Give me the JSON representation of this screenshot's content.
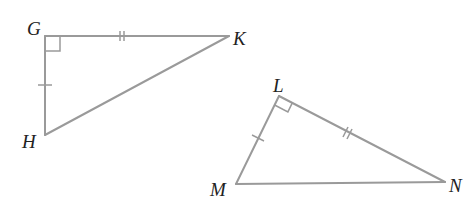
{
  "diagram": {
    "type": "geometry",
    "colors": {
      "line": "#9a9a9a",
      "label": "#222222",
      "background": "#ffffff"
    },
    "triangles": [
      {
        "name": "GHK",
        "right_angle_at": "G",
        "vertices": {
          "G": {
            "label": "G",
            "x": 45,
            "y": 36
          },
          "K": {
            "label": "K",
            "x": 229,
            "y": 36
          },
          "H": {
            "label": "H",
            "x": 45,
            "y": 135
          }
        },
        "marks": [
          {
            "side": "GK",
            "ticks": 2
          },
          {
            "side": "GH",
            "ticks": 1
          }
        ]
      },
      {
        "name": "LMN",
        "right_angle_at": "L",
        "vertices": {
          "L": {
            "label": "L",
            "x": 279,
            "y": 96
          },
          "M": {
            "label": "M",
            "x": 236,
            "y": 184
          },
          "N": {
            "label": "N",
            "x": 445,
            "y": 182
          }
        },
        "marks": [
          {
            "side": "LN",
            "ticks": 2
          },
          {
            "side": "LM",
            "ticks": 1
          }
        ]
      }
    ]
  }
}
